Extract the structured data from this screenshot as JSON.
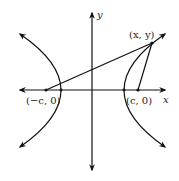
{
  "diagram": {
    "type": "hyperbola-foci",
    "axes": {
      "x_label": "x",
      "y_label": "y"
    },
    "points": {
      "left_focus": {
        "label": "(−c, 0)"
      },
      "right_focus": {
        "label": "(c, 0)"
      },
      "point_on_curve": {
        "label": "(x, y)"
      }
    },
    "colors": {
      "stroke": "#111111",
      "background": "#ffffff"
    }
  }
}
